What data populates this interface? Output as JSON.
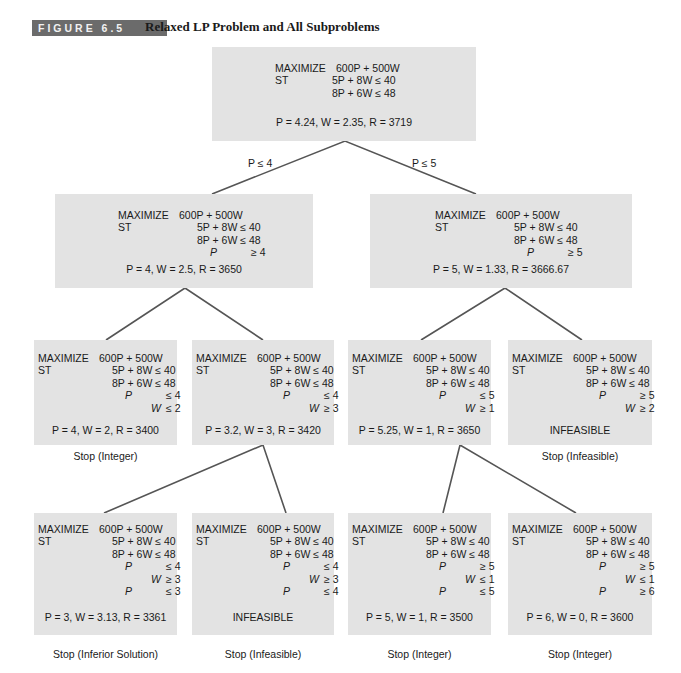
{
  "figure": {
    "badge": "FIGURE 6.5",
    "title": "Relaxed LP Problem and All Subproblems",
    "badge_color": "#6b6b6b",
    "box_color": "#e3e3e3",
    "line_color": "#555555"
  },
  "common": {
    "maximize": "MAXIMIZE",
    "objective": "600P + 500W",
    "st": "ST",
    "c1": "5P + 8W ≤ 40",
    "c2": "8P + 6W ≤ 48"
  },
  "branches": {
    "left": "P ≤ 4",
    "right": "P ≤ 5"
  },
  "nodes": {
    "root": {
      "extra": [],
      "result": "P = 4.24, W = 2.35, R = 3719",
      "caption": ""
    },
    "n2a": {
      "extra": [
        {
          "var": "P",
          "rel": "≥ 4"
        }
      ],
      "result": "P = 4, W = 2.5, R = 3650",
      "caption": ""
    },
    "n2b": {
      "extra": [
        {
          "var": "P",
          "rel": "≥ 5"
        }
      ],
      "result": "P = 5, W = 1.33, R = 3666.67",
      "caption": ""
    },
    "n3a": {
      "extra": [
        {
          "var": "P",
          "rel": "≤ 4"
        },
        {
          "var": "W",
          "rel": "≤ 2"
        }
      ],
      "result": "P = 4, W = 2, R = 3400",
      "caption": "Stop (Integer)"
    },
    "n3b": {
      "extra": [
        {
          "var": "P",
          "rel": "≤ 4"
        },
        {
          "var": "W",
          "rel": "≥ 3"
        }
      ],
      "result": "P = 3.2, W = 3, R = 3420",
      "caption": ""
    },
    "n3c": {
      "extra": [
        {
          "var": "P",
          "rel": "≤ 5"
        },
        {
          "var": "W",
          "rel": "≥ 1"
        }
      ],
      "result": "P = 5.25, W = 1, R = 3650",
      "caption": ""
    },
    "n3d": {
      "extra": [
        {
          "var": "P",
          "rel": "≥ 5"
        },
        {
          "var": "W",
          "rel": "≥ 2"
        }
      ],
      "result": "INFEASIBLE",
      "caption": "Stop (Infeasible)"
    },
    "n4a": {
      "extra": [
        {
          "var": "P",
          "rel": "≤ 4"
        },
        {
          "var": "W",
          "rel": "≥ 3"
        },
        {
          "var": "P",
          "rel": "≤ 3"
        }
      ],
      "result": "P = 3, W = 3.13, R = 3361",
      "caption": "Stop (Inferior Solution)"
    },
    "n4b": {
      "extra": [
        {
          "var": "P",
          "rel": "≤ 4"
        },
        {
          "var": "W",
          "rel": "≥ 3"
        },
        {
          "var": "P",
          "rel": "≤ 4"
        }
      ],
      "result": "INFEASIBLE",
      "caption": "Stop (Infeasible)"
    },
    "n4c": {
      "extra": [
        {
          "var": "P",
          "rel": "≥ 5"
        },
        {
          "var": "W",
          "rel": "≤ 1"
        },
        {
          "var": "P",
          "rel": "≤ 5"
        }
      ],
      "result": "P = 5, W = 1, R = 3500",
      "caption": "Stop (Integer)"
    },
    "n4d": {
      "extra": [
        {
          "var": "P",
          "rel": "≥ 5"
        },
        {
          "var": "W",
          "rel": "≤ 1"
        },
        {
          "var": "P",
          "rel": "≥ 6"
        }
      ],
      "result": "P = 6, W = 0, R = 3600",
      "caption": "Stop (Integer)"
    }
  }
}
